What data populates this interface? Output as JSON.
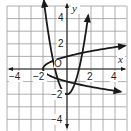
{
  "chart_data": {
    "type": "line",
    "title": "",
    "xlabel": "x",
    "ylabel": "y",
    "xlim": [
      -5,
      5
    ],
    "ylim": [
      -5,
      5
    ],
    "grid": true,
    "x_tick_labels": [
      "-4",
      "-2",
      "2",
      "4"
    ],
    "y_tick_labels": [
      "4",
      "2",
      "-2",
      "-4"
    ],
    "origin_label": "O",
    "series": [
      {
        "name": "y = 2x^2 - 2",
        "description": "upward-opening parabola, vertex (0,-2)",
        "x": [
          -1.9,
          -1.5,
          -1,
          -0.5,
          0,
          0.5,
          1,
          1.5,
          1.8
        ],
        "y": [
          5.22,
          2.5,
          0,
          -1.5,
          -2,
          -1.5,
          0,
          2.5,
          4.48
        ]
      },
      {
        "name": "x = 2y^2 - 2",
        "description": "right-opening parabola, vertex (-2,0)",
        "x": [
          4.9,
          2.5,
          0,
          -1.5,
          -2,
          -1.5,
          0,
          2.5,
          4.9
        ],
        "y": [
          -1.86,
          -1.5,
          -1,
          -0.5,
          0,
          0.5,
          1,
          1.5,
          1.86
        ]
      }
    ]
  },
  "labels": {
    "x_axis": "x",
    "y_axis": "y",
    "origin": "O",
    "xt_m4": "−4",
    "xt_m2": "−2",
    "xt_2": "2",
    "xt_4": "4",
    "yt_4": "4",
    "yt_2": "2",
    "yt_m2": "−2",
    "yt_m4": "−4"
  }
}
